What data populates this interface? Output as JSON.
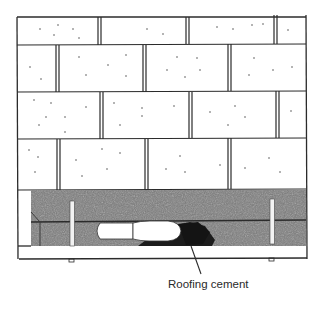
{
  "diagram": {
    "callouts": [
      {
        "label": "Roofing cement"
      }
    ],
    "colors": {
      "line": "#2b2b2b",
      "cement_band": "#6e6e6e",
      "cement_dark": "#1f1f1f",
      "background": "#ffffff"
    }
  }
}
